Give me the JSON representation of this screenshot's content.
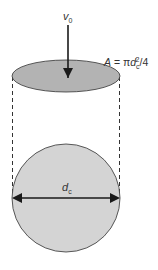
{
  "diagram": {
    "colors": {
      "disk_fill": "#b3b3b3",
      "circle_fill": "#d4d4d4",
      "stroke": "#333333",
      "arrow": "#1a1a1a",
      "background": "#ffffff"
    },
    "velocity_label": {
      "symbol": "v",
      "subscript": "0"
    },
    "area_formula": {
      "lhs": "A",
      "eq": " = π",
      "var": "d",
      "subscript": "c",
      "superscript": "2",
      "tail": "/4"
    },
    "diameter_label": {
      "symbol": "d",
      "subscript": "c"
    },
    "elements": [
      "velocity arrow pointing down onto disk",
      "top elliptical disk (area A)",
      "dashed projection lines",
      "circular cross-section with diameter arrow"
    ]
  }
}
